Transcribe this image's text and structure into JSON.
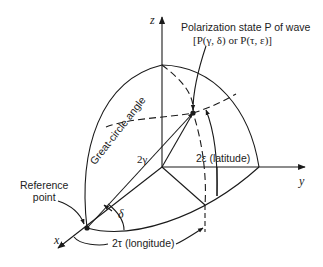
{
  "diagram": {
    "type": "poincare-sphere-octant",
    "axes": {
      "x": "x",
      "y": "y",
      "z": "z"
    },
    "labels": {
      "polarization_line1": "Polarization state P of wave",
      "polarization_line2": "[P(γ, δ) or P(τ, ε)]",
      "reference_line1": "Reference",
      "reference_line2": "point",
      "great_circle": "Great-circle angle",
      "two_gamma": "2γ",
      "delta": "δ",
      "latitude": "2ε (latitude)",
      "longitude": "2τ (longitude)"
    },
    "line_color": "#1a1a1a"
  }
}
